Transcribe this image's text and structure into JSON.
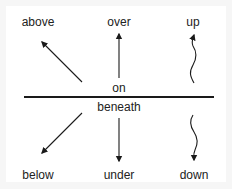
{
  "diagram": {
    "type": "prepositions-of-position",
    "divider_color": "#1a1a1a",
    "arrow_color": "#1a1a1a",
    "labels": {
      "above": "above",
      "over": "over",
      "up": "up",
      "on": "on",
      "beneath": "beneath",
      "below": "below",
      "under": "under",
      "down": "down"
    },
    "arrows": [
      {
        "name": "above",
        "style": "straight",
        "direction": "up-left"
      },
      {
        "name": "over",
        "style": "straight",
        "direction": "up"
      },
      {
        "name": "up",
        "style": "wavy",
        "direction": "up"
      },
      {
        "name": "below",
        "style": "straight",
        "direction": "down-left"
      },
      {
        "name": "under",
        "style": "straight",
        "direction": "down"
      },
      {
        "name": "down",
        "style": "wavy",
        "direction": "down"
      }
    ]
  }
}
